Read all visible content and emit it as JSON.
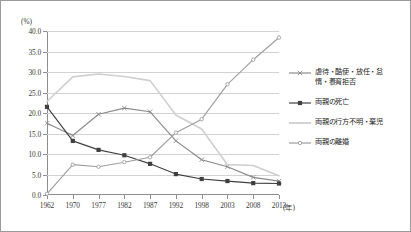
{
  "chart_data": {
    "type": "line",
    "title": "",
    "xlabel": "(年)",
    "ylabel": "(%)",
    "ylim": [
      0,
      40
    ],
    "ytick_step": 5,
    "grid": true,
    "legend_position": "right",
    "categories": [
      "1962",
      "1970",
      "1977",
      "1982",
      "1987",
      "1992",
      "1998",
      "2003",
      "2008",
      "2013"
    ],
    "ytick_labels": [
      "0.0",
      "5.0",
      "10.0",
      "15.0",
      "20.0",
      "25.0",
      "30.0",
      "35.0",
      "40.0"
    ],
    "series": [
      {
        "name": "虐待・酷使・放任・怠\n惰・養育拒否",
        "legend_label": "虐待・酷使・放任・怠\n惰・養育拒否",
        "color": "#8a8a8a",
        "marker": "x",
        "values": [
          17.5,
          14.5,
          19.7,
          21.2,
          20.3,
          13.2,
          8.6,
          6.9,
          4.3,
          3.4
        ]
      },
      {
        "name": "両親の死亡",
        "legend_label": "両親の死亡",
        "color": "#404040",
        "marker": "square",
        "values": [
          21.5,
          13.2,
          11.0,
          9.7,
          7.6,
          5.1,
          3.9,
          3.4,
          2.9,
          2.8
        ]
      },
      {
        "name": "両親の行方不明・棄児",
        "legend_label": "両親の行方不明・棄児",
        "color": "#cfcfcf",
        "marker": "none",
        "values": [
          22.8,
          28.8,
          29.5,
          28.9,
          27.9,
          19.5,
          16.1,
          7.4,
          7.2,
          4.7
        ]
      },
      {
        "name": "両親の離婚",
        "legend_label": "両親の離婚",
        "color": "#9e9e9e",
        "marker": "dot",
        "values": [
          0.3,
          7.4,
          6.9,
          8.0,
          9.2,
          15.2,
          18.5,
          27.0,
          33.0,
          38.4
        ]
      }
    ]
  },
  "axes": {
    "y_unit": "(%)",
    "x_unit": "(年)"
  }
}
